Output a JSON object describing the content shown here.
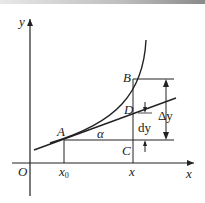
{
  "diagram": {
    "title": "",
    "labels": {
      "y_axis": "y",
      "x_axis": "x",
      "origin": "O",
      "x0": "x",
      "x0_sub": "0",
      "x": "x",
      "A": "A",
      "B": "B",
      "C": "C",
      "D": "D",
      "alpha": "α",
      "delta_y": "Δy",
      "dy": "dy"
    },
    "colors": {
      "stroke": "#222222",
      "background": "#ffffff"
    }
  }
}
